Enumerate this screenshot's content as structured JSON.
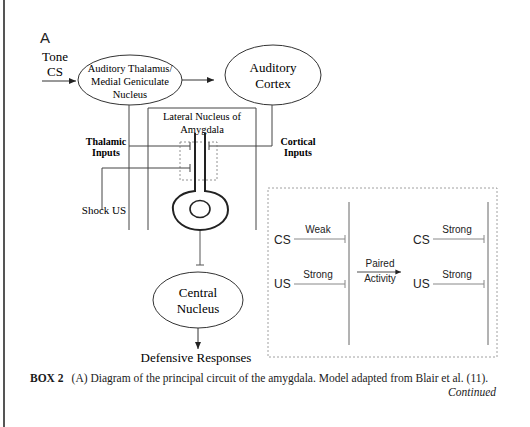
{
  "figure": {
    "panel_label": "A",
    "inputs": {
      "tone_cs_line1": "Tone",
      "tone_cs_line2": "CS",
      "shock_us": "Shock US",
      "thalamic_inputs_line1": "Thalamic",
      "thalamic_inputs_line2": "Inputs",
      "cortical_inputs_line1": "Cortical",
      "cortical_inputs_line2": "Inputs"
    },
    "nodes": {
      "auditory_thalamus_line1": "Auditory Thalamus/",
      "auditory_thalamus_line2": "Medial Geniculate",
      "auditory_thalamus_line3": "Nucleus",
      "auditory_cortex_line1": "Auditory",
      "auditory_cortex_line2": "Cortex",
      "lateral_nucleus_line1": "Lateral Nucleus of",
      "lateral_nucleus_line2": "Amygdala",
      "central_nucleus_line1": "Central",
      "central_nucleus_line2": "Nucleus",
      "output": "Defensive Responses"
    },
    "inset": {
      "before": {
        "cs_label": "CS",
        "cs_strength": "Weak",
        "us_label": "US",
        "us_strength": "Strong"
      },
      "transition_line1": "Paired",
      "transition_line2": "Activity",
      "after": {
        "cs_label": "CS",
        "cs_strength": "Strong",
        "us_label": "US",
        "us_strength": "Strong"
      }
    }
  },
  "caption": {
    "label": "BOX 2",
    "text": "(A) Diagram of the principal circuit of the amygdala. Model adapted from Blair et al. (11).",
    "continued": "Continued"
  }
}
